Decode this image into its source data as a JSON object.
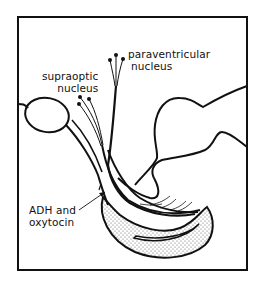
{
  "diagram": {
    "labels": {
      "paraventricular": {
        "line1": "paraventricular",
        "line2": "nucleus"
      },
      "supraoptic": {
        "line1": "supraoptic",
        "line2": "nucleus"
      },
      "hormones": {
        "line1": "ADH and",
        "line2": "oxytocin"
      }
    },
    "colors": {
      "ink": "#111111",
      "background": "#ffffff",
      "stipple": "#555555"
    }
  }
}
